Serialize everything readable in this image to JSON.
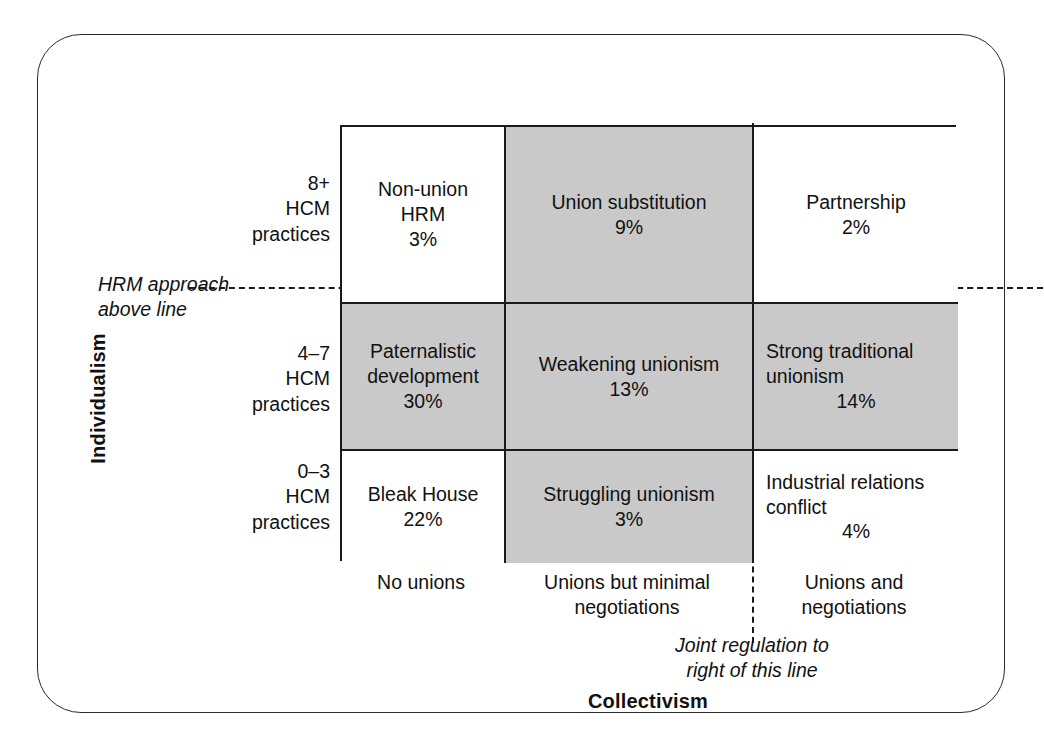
{
  "chart_data": {
    "type": "table",
    "title": "",
    "xlabel": "Collectivism",
    "ylabel": "Individualism",
    "categories_x": [
      "No unions",
      "Unions but minimal negotiations",
      "Unions and negotiations"
    ],
    "categories_y": [
      "8+ HCM practices",
      "4–7 HCM practices",
      "0–3 HCM practices"
    ],
    "cells": [
      {
        "row": 0,
        "col": 0,
        "label": "Non-union HRM",
        "value": 3,
        "pct": "3%",
        "shaded": false
      },
      {
        "row": 0,
        "col": 1,
        "label": "Union substitution",
        "value": 9,
        "pct": "9%",
        "shaded": true
      },
      {
        "row": 0,
        "col": 2,
        "label": "Partnership",
        "value": 2,
        "pct": "2%",
        "shaded": false
      },
      {
        "row": 1,
        "col": 0,
        "label": "Paternalistic development",
        "value": 30,
        "pct": "30%",
        "shaded": true
      },
      {
        "row": 1,
        "col": 1,
        "label": "Weakening unionism",
        "value": 13,
        "pct": "13%",
        "shaded": true
      },
      {
        "row": 1,
        "col": 2,
        "label": "Strong traditional unionism",
        "value": 14,
        "pct": "14%",
        "shaded": true
      },
      {
        "row": 2,
        "col": 0,
        "label": "Bleak House",
        "value": 22,
        "pct": "22%",
        "shaded": false
      },
      {
        "row": 2,
        "col": 1,
        "label": "Struggling unionism",
        "value": 3,
        "pct": "3%",
        "shaded": true
      },
      {
        "row": 2,
        "col": 2,
        "label": "Industrial relations conflict",
        "value": 4,
        "pct": "4%",
        "shaded": false
      }
    ],
    "annotations": [
      {
        "name": "hrm-approach-line",
        "text": "HRM approach above line",
        "orientation": "horizontal"
      },
      {
        "name": "joint-regulation-line",
        "text": "Joint regulation to right of this line",
        "orientation": "vertical"
      }
    ]
  },
  "axes": {
    "y": {
      "title": "Individualism",
      "rows": [
        {
          "line1": "8+",
          "line2": "HCM",
          "line3": "practices"
        },
        {
          "line1": "4–7",
          "line2": "HCM",
          "line3": "practices"
        },
        {
          "line1": "0–3",
          "line2": "HCM",
          "line3": "practices"
        }
      ]
    },
    "x": {
      "title": "Collectivism",
      "cols": [
        {
          "line1": "No unions",
          "line2": ""
        },
        {
          "line1": "Unions but minimal",
          "line2": "negotiations"
        },
        {
          "line1": "Unions and",
          "line2": "negotiations"
        }
      ]
    }
  },
  "notes": {
    "hrm": {
      "line1": "HRM approach",
      "line2": "above line"
    },
    "joint": {
      "line1": "Joint regulation to",
      "line2": "right of this line"
    }
  },
  "matrix": {
    "r0c0": {
      "label": "Non-union HRM",
      "pct": "3%"
    },
    "r0c1": {
      "label": "Union substitution",
      "pct": "9%"
    },
    "r0c2": {
      "label": "Partnership",
      "pct": "2%"
    },
    "r1c0": {
      "label": "Paternalistic development",
      "pct": "30%"
    },
    "r1c1": {
      "label": "Weakening unionism",
      "pct": "13%"
    },
    "r1c2": {
      "label": "Strong traditional unionism",
      "pct": "14%"
    },
    "r2c0": {
      "label": "Bleak House",
      "pct": "22%"
    },
    "r2c1": {
      "label": "Struggling unionism",
      "pct": "3%"
    },
    "r2c2": {
      "label": "Industrial relations conflict",
      "pct": "4%"
    }
  },
  "colors": {
    "shaded_cell": "#c9c9c9",
    "grid_line": "#1a1a1a",
    "frame": "#2b2b2b",
    "text": "#111111",
    "background": "#ffffff"
  }
}
